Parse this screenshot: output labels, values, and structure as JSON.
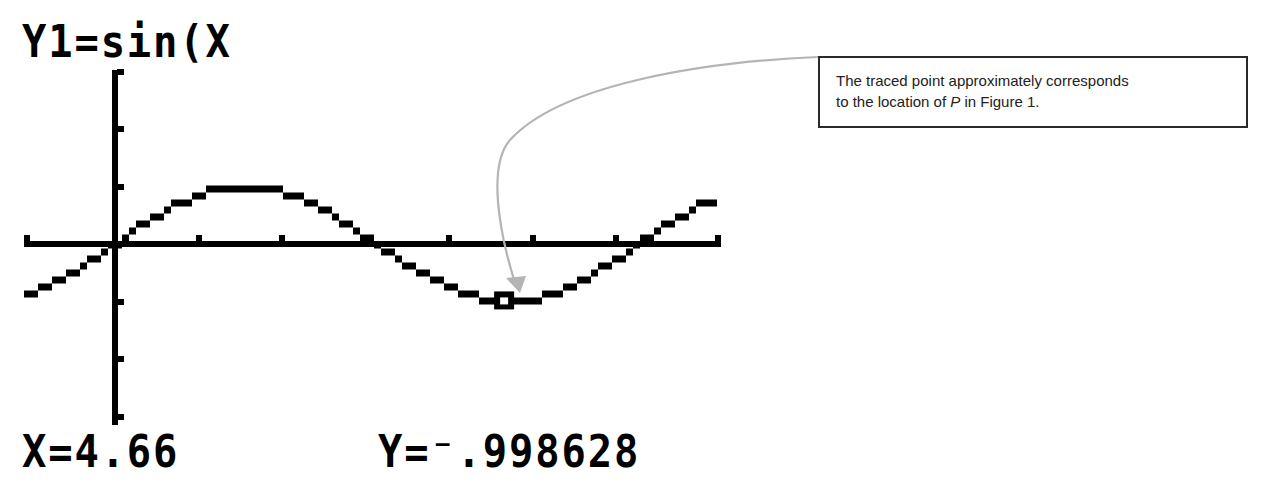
{
  "calculator": {
    "function_label": "Y1=sin(X",
    "x_readout": "X=4.66",
    "y_readout": "Y=⁻.998628"
  },
  "annotation": {
    "line1": "The traced point approximately corresponds",
    "line2_prefix": "to the location of ",
    "line2_var": "P",
    "line2_suffix": " in Figure 1."
  },
  "colors": {
    "ink": "#000000",
    "arrow": "#b4b4b4",
    "box_border": "#2a2a2a",
    "background": "#ffffff"
  },
  "chart_data": {
    "type": "line",
    "title": "Y1=sin(X",
    "function": "sin(x)",
    "xlabel": "",
    "ylabel": "",
    "xlim": [
      -1.09,
      7.26
    ],
    "ylim": [
      -3.1,
      3.05
    ],
    "x_ticks": [
      1,
      2,
      3,
      4,
      5,
      6
    ],
    "y_ticks": [
      -3,
      -2,
      -1,
      1,
      2,
      3
    ],
    "grid": false,
    "legend": null,
    "traced_point": {
      "x": 4.66,
      "y": -0.998628
    },
    "sample_x": [
      -1,
      0,
      0.5,
      1,
      1.5707963,
      2,
      2.5,
      3,
      3.1415927,
      3.5,
      4,
      4.66,
      5,
      5.5,
      6,
      6.2831853,
      7
    ],
    "sample_y": [
      -0.841,
      0,
      0.479,
      0.841,
      1,
      0.909,
      0.598,
      0.141,
      0,
      -0.351,
      -0.757,
      -0.999,
      -0.959,
      -0.706,
      -0.279,
      0,
      0.657
    ]
  },
  "plot_geometry": {
    "origin_px": [
      115,
      244
    ],
    "x_px_per_unit": 83.5,
    "y_px_per_unit": 57.5,
    "x_axis_px_range": [
      24,
      721
    ],
    "y_axis_px_range": [
      70,
      425
    ],
    "pixel_size": 7
  }
}
